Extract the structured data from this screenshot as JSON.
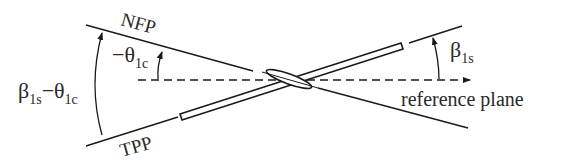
{
  "diagram": {
    "type": "rotor-blade-flapping-planes",
    "labels": {
      "nfp": "NFP",
      "tpp": "TPP",
      "reference_plane": "reference plane",
      "beta_1s": {
        "main": "β",
        "sub": "1s"
      },
      "neg_theta_1c": {
        "main": "−θ",
        "sub": "1c"
      },
      "beta_minus_theta": {
        "main1": "β",
        "sub1": "1s",
        "op": "−θ",
        "sub2": "1c"
      }
    },
    "colors": {
      "stroke": "#1a1a1a",
      "text": "#2a2a2a",
      "background": "#ffffff"
    }
  }
}
